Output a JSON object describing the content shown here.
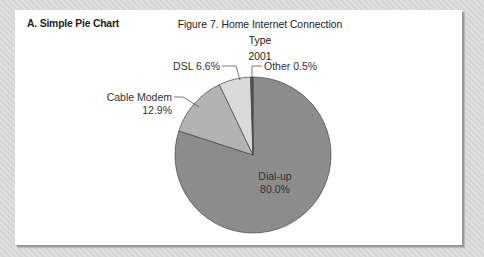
{
  "panel": {
    "section_label": "A. Simple Pie Chart",
    "title_line1": "Figure 7. Home Internet Connection Type",
    "title_line2": "2001"
  },
  "labels": {
    "dialup_name": "Dial-up",
    "dialup_value": "80.0%",
    "cable_name": "Cable Modem",
    "cable_value": "12.9%",
    "dsl": "DSL 6.6%",
    "other": "Other 0.5%"
  },
  "colors": {
    "background": "#dcdcdc",
    "panel": "#ffffff",
    "dialup": "#8c8c8c",
    "cable": "#b3b3b3",
    "dsl": "#dadada",
    "other": "#555555"
  },
  "chart_data": {
    "type": "pie",
    "title": "Figure 7. Home Internet Connection Type 2001",
    "subtitle": "A. Simple Pie Chart",
    "categories": [
      "Dial-up",
      "Cable Modem",
      "DSL",
      "Other"
    ],
    "values": [
      80.0,
      12.9,
      6.6,
      0.5
    ],
    "unit": "%",
    "labels": [
      "Dial-up 80.0%",
      "Cable Modem 12.9%",
      "DSL 6.6%",
      "Other 0.5%"
    ],
    "legend": "none (direct labels with leader lines)"
  }
}
